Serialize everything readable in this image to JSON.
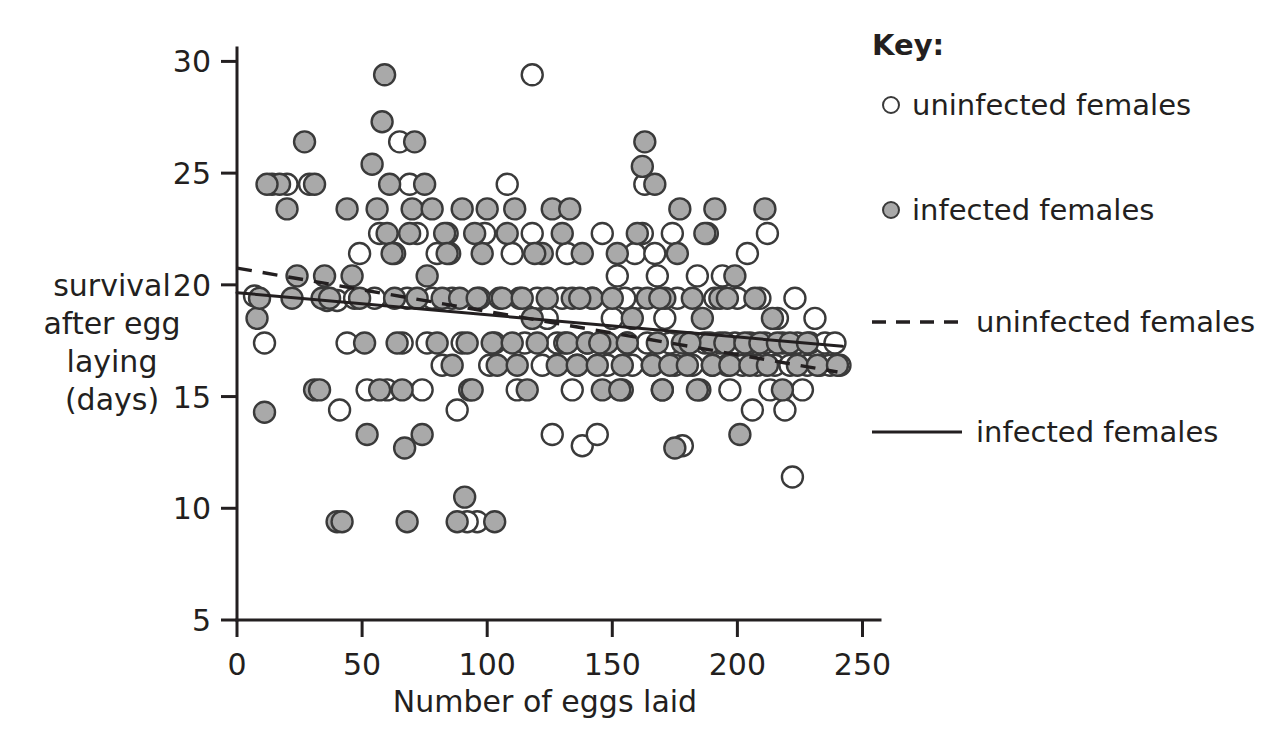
{
  "chart_data": {
    "type": "scatter",
    "title": "",
    "xlabel": "Number of eggs laid",
    "ylabel": "survival after egg laying (days)",
    "ylabel_lines": [
      "survival",
      "after egg",
      "laying",
      "(days)"
    ],
    "xlim": [
      0,
      257
    ],
    "ylim": [
      5,
      30.6
    ],
    "xticks": [
      0,
      50,
      100,
      150,
      200,
      250
    ],
    "xticklabels": [
      "0",
      "50",
      "100",
      "150",
      "200",
      "250"
    ],
    "yticks": [
      5,
      10,
      15,
      20,
      25,
      30
    ],
    "yticklabels": [
      "5",
      "10",
      "15",
      "20",
      "25",
      "30"
    ],
    "grid": false,
    "legend_position": "right",
    "colors": {
      "uninfected_marker_fill": "#ffffff",
      "infected_marker_fill": "#a9a9a9",
      "marker_stroke": "#3a3a3a",
      "line": "#231f20",
      "text": "#231f20",
      "background": "#ffffff"
    },
    "series": [
      {
        "name": "uninfected females",
        "marker": "open-circle",
        "points": [
          [
            7,
            19.5
          ],
          [
            11,
            17.4
          ],
          [
            20,
            24.5
          ],
          [
            29,
            24.5
          ],
          [
            36,
            19.3
          ],
          [
            40,
            19.3
          ],
          [
            41,
            14.4
          ],
          [
            44,
            17.4
          ],
          [
            47,
            19.4
          ],
          [
            49,
            21.4
          ],
          [
            52,
            15.3
          ],
          [
            57,
            22.3
          ],
          [
            60,
            15.3
          ],
          [
            63,
            21.4
          ],
          [
            65,
            26.4
          ],
          [
            66,
            17.4
          ],
          [
            68,
            19.4
          ],
          [
            69,
            24.5
          ],
          [
            72,
            22.3
          ],
          [
            74,
            15.3
          ],
          [
            76,
            17.4
          ],
          [
            78,
            19.4
          ],
          [
            80,
            21.4
          ],
          [
            82,
            16.4
          ],
          [
            84,
            22.3
          ],
          [
            86,
            19.4
          ],
          [
            88,
            14.4
          ],
          [
            90,
            17.4
          ],
          [
            93,
            15.3
          ],
          [
            96,
            9.4
          ],
          [
            97,
            19.4
          ],
          [
            99,
            22.3
          ],
          [
            101,
            16.4
          ],
          [
            103,
            17.4
          ],
          [
            105,
            19.4
          ],
          [
            108,
            24.5
          ],
          [
            110,
            21.4
          ],
          [
            112,
            15.3
          ],
          [
            115,
            17.4
          ],
          [
            118,
            29.4
          ],
          [
            118,
            22.3
          ],
          [
            120,
            19.4
          ],
          [
            122,
            16.4
          ],
          [
            124,
            18.5
          ],
          [
            126,
            13.3
          ],
          [
            128,
            17.4
          ],
          [
            130,
            19.4
          ],
          [
            132,
            21.4
          ],
          [
            134,
            15.3
          ],
          [
            136,
            16.4
          ],
          [
            138,
            12.8
          ],
          [
            140,
            17.4
          ],
          [
            142,
            19.4
          ],
          [
            144,
            13.3
          ],
          [
            146,
            22.3
          ],
          [
            148,
            16.4
          ],
          [
            150,
            18.5
          ],
          [
            152,
            20.4
          ],
          [
            154,
            15.3
          ],
          [
            156,
            17.4
          ],
          [
            158,
            16.4
          ],
          [
            160,
            19.4
          ],
          [
            162,
            22.3
          ],
          [
            163,
            24.5
          ],
          [
            164,
            17.4
          ],
          [
            166,
            16.4
          ],
          [
            168,
            20.4
          ],
          [
            170,
            15.3
          ],
          [
            171,
            18.5
          ],
          [
            173,
            17.4
          ],
          [
            175,
            16.4
          ],
          [
            176,
            19.4
          ],
          [
            178,
            12.8
          ],
          [
            180,
            17.4
          ],
          [
            182,
            16.4
          ],
          [
            184,
            20.4
          ],
          [
            185,
            15.3
          ],
          [
            187,
            17.4
          ],
          [
            188,
            22.3
          ],
          [
            190,
            16.4
          ],
          [
            191,
            19.4
          ],
          [
            193,
            17.4
          ],
          [
            194,
            20.4
          ],
          [
            196,
            16.4
          ],
          [
            197,
            15.3
          ],
          [
            199,
            17.4
          ],
          [
            200,
            19.4
          ],
          [
            202,
            16.4
          ],
          [
            204,
            21.4
          ],
          [
            205,
            17.4
          ],
          [
            206,
            14.4
          ],
          [
            208,
            16.4
          ],
          [
            209,
            19.4
          ],
          [
            211,
            17.4
          ],
          [
            212,
            22.3
          ],
          [
            213,
            15.3
          ],
          [
            215,
            16.4
          ],
          [
            216,
            18.5
          ],
          [
            218,
            17.4
          ],
          [
            219,
            14.4
          ],
          [
            221,
            16.4
          ],
          [
            222,
            11.4
          ],
          [
            223,
            19.4
          ],
          [
            224,
            17.4
          ],
          [
            226,
            15.3
          ],
          [
            228,
            16.4
          ],
          [
            229,
            17.4
          ],
          [
            231,
            18.5
          ],
          [
            233,
            16.4
          ],
          [
            235,
            17.4
          ],
          [
            237,
            16.4
          ],
          [
            239,
            17.4
          ],
          [
            241,
            16.4
          ],
          [
            155,
            19.4
          ],
          [
            159,
            21.4
          ],
          [
            167,
            21.4
          ],
          [
            174,
            22.3
          ],
          [
            55,
            19.4
          ],
          [
            85,
            21.4
          ],
          [
            92,
            9.4
          ],
          [
            113,
            19.4
          ],
          [
            131,
            17.4
          ]
        ]
      },
      {
        "name": "infected females",
        "marker": "filled-circle",
        "points": [
          [
            8,
            18.5
          ],
          [
            9,
            19.4
          ],
          [
            11,
            14.3
          ],
          [
            14,
            24.5
          ],
          [
            17,
            24.5
          ],
          [
            20,
            23.4
          ],
          [
            24,
            20.4
          ],
          [
            27,
            26.4
          ],
          [
            31,
            15.3
          ],
          [
            33,
            15.3
          ],
          [
            34,
            19.4
          ],
          [
            37,
            19.4
          ],
          [
            40,
            9.4
          ],
          [
            42,
            9.4
          ],
          [
            44,
            23.4
          ],
          [
            46,
            20.4
          ],
          [
            49,
            19.4
          ],
          [
            52,
            13.3
          ],
          [
            54,
            25.4
          ],
          [
            56,
            23.4
          ],
          [
            58,
            27.3
          ],
          [
            59,
            29.4
          ],
          [
            60,
            22.3
          ],
          [
            62,
            21.4
          ],
          [
            63,
            19.4
          ],
          [
            64,
            17.4
          ],
          [
            66,
            15.3
          ],
          [
            67,
            12.7
          ],
          [
            68,
            9.4
          ],
          [
            69,
            22.3
          ],
          [
            70,
            23.4
          ],
          [
            71,
            26.4
          ],
          [
            72,
            19.4
          ],
          [
            74,
            13.3
          ],
          [
            76,
            20.4
          ],
          [
            78,
            23.4
          ],
          [
            80,
            17.4
          ],
          [
            82,
            19.4
          ],
          [
            83,
            22.3
          ],
          [
            84,
            21.4
          ],
          [
            86,
            16.4
          ],
          [
            88,
            9.4
          ],
          [
            89,
            19.4
          ],
          [
            90,
            23.4
          ],
          [
            91,
            10.5
          ],
          [
            92,
            17.4
          ],
          [
            94,
            15.3
          ],
          [
            96,
            19.4
          ],
          [
            98,
            21.4
          ],
          [
            100,
            23.4
          ],
          [
            102,
            17.4
          ],
          [
            103,
            9.4
          ],
          [
            104,
            16.4
          ],
          [
            106,
            19.4
          ],
          [
            108,
            22.3
          ],
          [
            110,
            17.4
          ],
          [
            112,
            16.4
          ],
          [
            114,
            19.4
          ],
          [
            116,
            15.3
          ],
          [
            118,
            18.5
          ],
          [
            120,
            17.4
          ],
          [
            122,
            21.4
          ],
          [
            124,
            19.4
          ],
          [
            126,
            23.4
          ],
          [
            128,
            16.4
          ],
          [
            130,
            22.3
          ],
          [
            132,
            17.4
          ],
          [
            133,
            23.4
          ],
          [
            134,
            19.4
          ],
          [
            136,
            16.4
          ],
          [
            138,
            21.4
          ],
          [
            140,
            17.4
          ],
          [
            142,
            19.4
          ],
          [
            144,
            16.4
          ],
          [
            146,
            15.3
          ],
          [
            148,
            17.4
          ],
          [
            150,
            19.4
          ],
          [
            152,
            21.4
          ],
          [
            154,
            16.4
          ],
          [
            156,
            17.4
          ],
          [
            158,
            18.5
          ],
          [
            160,
            22.3
          ],
          [
            162,
            25.3
          ],
          [
            163,
            26.4
          ],
          [
            164,
            19.4
          ],
          [
            166,
            16.4
          ],
          [
            167,
            24.5
          ],
          [
            168,
            17.4
          ],
          [
            170,
            15.3
          ],
          [
            171,
            19.4
          ],
          [
            173,
            16.4
          ],
          [
            175,
            12.7
          ],
          [
            176,
            21.4
          ],
          [
            178,
            17.4
          ],
          [
            180,
            16.4
          ],
          [
            182,
            19.4
          ],
          [
            184,
            15.3
          ],
          [
            186,
            18.5
          ],
          [
            187,
            22.3
          ],
          [
            189,
            17.4
          ],
          [
            190,
            16.4
          ],
          [
            191,
            23.4
          ],
          [
            193,
            19.4
          ],
          [
            195,
            17.4
          ],
          [
            197,
            16.4
          ],
          [
            199,
            20.4
          ],
          [
            201,
            13.3
          ],
          [
            203,
            17.4
          ],
          [
            205,
            16.4
          ],
          [
            207,
            19.4
          ],
          [
            209,
            17.4
          ],
          [
            211,
            23.4
          ],
          [
            212,
            16.4
          ],
          [
            214,
            18.5
          ],
          [
            216,
            17.4
          ],
          [
            218,
            15.3
          ],
          [
            221,
            17.4
          ],
          [
            224,
            16.4
          ],
          [
            228,
            17.4
          ],
          [
            232,
            16.4
          ],
          [
            240,
            16.4
          ],
          [
            31,
            24.5
          ],
          [
            12,
            24.5
          ],
          [
            22,
            19.4
          ],
          [
            35,
            20.4
          ],
          [
            51,
            17.4
          ],
          [
            57,
            15.3
          ],
          [
            61,
            24.5
          ],
          [
            75,
            24.5
          ],
          [
            95,
            22.3
          ],
          [
            111,
            23.4
          ],
          [
            119,
            21.4
          ],
          [
            137,
            19.4
          ],
          [
            145,
            17.4
          ],
          [
            153,
            15.3
          ],
          [
            169,
            19.4
          ],
          [
            177,
            23.4
          ],
          [
            181,
            17.4
          ],
          [
            196,
            19.4
          ]
        ]
      }
    ],
    "trendlines": [
      {
        "name": "uninfected females",
        "style": "dashed",
        "x0": 0,
        "y0": 20.75,
        "x1": 240,
        "y1": 16.1
      },
      {
        "name": "infected females",
        "style": "solid",
        "x0": 0,
        "y0": 19.65,
        "x1": 242,
        "y1": 17.25
      }
    ],
    "legend": {
      "title": "Key:",
      "entries": [
        {
          "symbol": "open-circle",
          "label": "uninfected females"
        },
        {
          "symbol": "filled-circle",
          "label": "infected females"
        },
        {
          "symbol": "dashed-line",
          "label": "uninfected females"
        },
        {
          "symbol": "solid-line",
          "label": "infected females"
        }
      ]
    }
  }
}
